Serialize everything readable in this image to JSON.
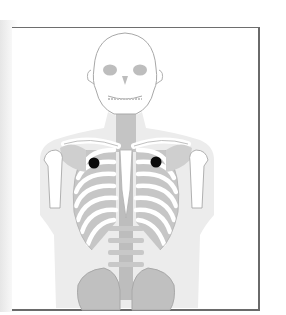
{
  "figure": {
    "colors": {
      "background": "#ffffff",
      "frame": "#6a6a6a",
      "soft_tissue": "#ececec",
      "bone_shade": "#bdbdbd",
      "bone_fill": "#ffffff",
      "bone_outline": "#a8a8a8",
      "marker": "#0a0a0a"
    },
    "markers": [
      {
        "name": "left-chest-marker",
        "cx": 94,
        "cy": 163,
        "r": 5.5
      },
      {
        "name": "right-chest-marker",
        "cx": 156,
        "cy": 162,
        "r": 5.5
      }
    ]
  }
}
